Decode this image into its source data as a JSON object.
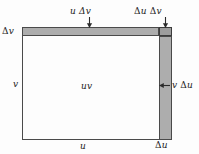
{
  "figure": {
    "colors": {
      "background": "#fdfdfd",
      "stroke": "#4a4a4a",
      "shade": "#adadad",
      "corner_shade": "#9d9d9d",
      "text": "#1c1c1c"
    }
  },
  "labels": {
    "top_band": "u Δv",
    "corner": "Δu Δv",
    "left_band_height": "Δv",
    "left_side": "v",
    "center": "uv",
    "right_band": "v Δu",
    "bottom": "u",
    "bottom_right": "Δu"
  },
  "icons": {
    "arrow_down": "arrow-down-icon",
    "arrow_down_corner": "arrow-down-icon",
    "arrow_left": "arrow-left-icon"
  }
}
